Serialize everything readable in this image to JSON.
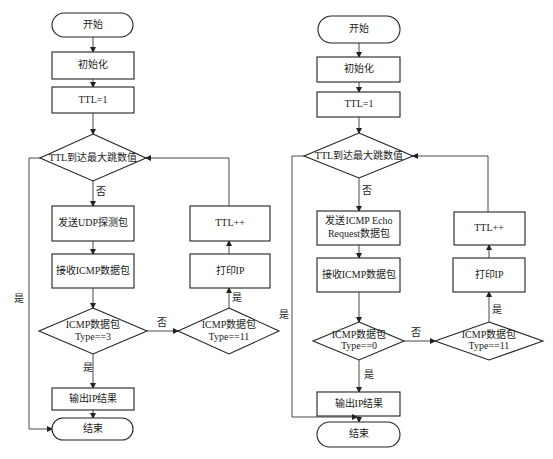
{
  "colors": {
    "stroke": "#222222",
    "fill": "#ffffff",
    "background": "#ffffff"
  },
  "left_flowchart": {
    "start": "开始",
    "init": "初始化",
    "ttl_set": "TTL=1",
    "decision_max_hops": "TTL到达最大跳数值",
    "label_no_1": "否",
    "send": "发送UDP探测包",
    "receive": "接收ICMP数据包",
    "decision_type_line1": "ICMP数据包",
    "decision_type_line2": "Type==3",
    "label_no_2": "否",
    "decision_type11_line1": "ICMP数据包",
    "decision_type11_line2": "Type==11",
    "label_yes_print": "是",
    "print_ip": "打印IP",
    "ttl_inc": "TTL++",
    "label_yes_output": "是",
    "output": "输出IP结果",
    "label_yes_loop": "是",
    "end": "结束"
  },
  "right_flowchart": {
    "start": "开始",
    "init": "初始化",
    "ttl_set": "TTL=1",
    "decision_max_hops": "TTL到达最大跳数值",
    "label_no_1": "否",
    "send_line1": "发送ICMP Echo",
    "send_line2": "Request数据包",
    "receive": "接收ICMP数据包",
    "decision_type_line1": "ICMP数据包",
    "decision_type_line2": "Type==0",
    "label_no_2": "否",
    "decision_type11_line1": "ICMP数据包",
    "decision_type11_line2": "Type==11",
    "label_yes_print": "是",
    "print_ip": "打印IP",
    "ttl_inc": "TTL++",
    "label_yes_output": "是",
    "output": "输出IP结果",
    "label_yes_loop": "是",
    "end": "结束"
  }
}
